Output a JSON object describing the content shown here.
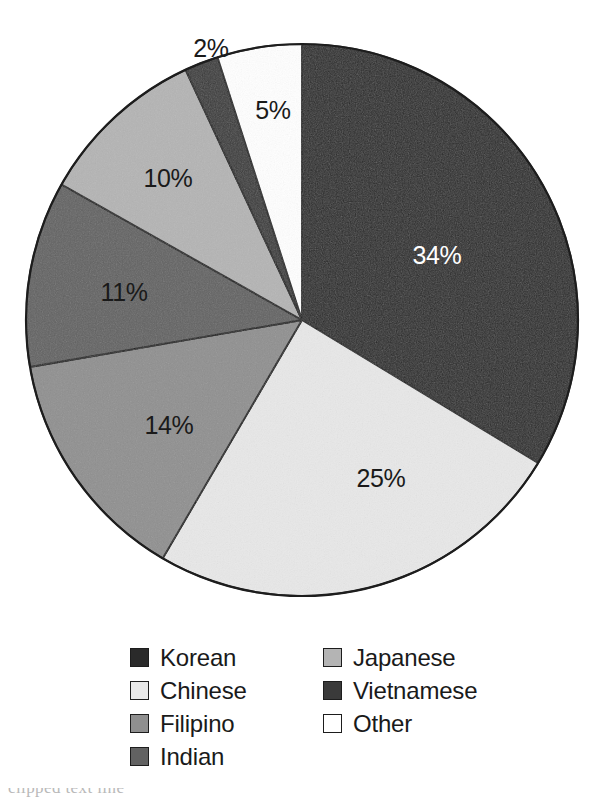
{
  "chart_data": {
    "type": "pie",
    "title": "",
    "subtitle": "",
    "xlabel": "",
    "ylabel": "",
    "units": "percent",
    "legend_position": "bottom",
    "grid": false,
    "start_angle_deg": 0,
    "direction": "clockwise",
    "categories": [
      "Korean",
      "Chinese",
      "Filipino",
      "Indian",
      "Japanese",
      "Vietnamese",
      "Other"
    ],
    "values": [
      34,
      25,
      14,
      11,
      10,
      2,
      5
    ],
    "data_labels": [
      "34%",
      "25%",
      "14%",
      "11%",
      "10%",
      "2%",
      "5%"
    ],
    "colors": [
      "#2a2a2a",
      "#e8e8e8",
      "#8f8f8f",
      "#626262",
      "#b4b4b4",
      "#3a3a3a",
      "#ffffff"
    ],
    "label_text_colors": [
      "#ffffff",
      "#1a1a1a",
      "#1a1a1a",
      "#1a1a1a",
      "#1a1a1a",
      "#1a1a1a",
      "#1a1a1a"
    ],
    "slices": [
      {
        "name": "Korean",
        "value": 34,
        "label": "34%",
        "color": "#2a2a2a",
        "label_color": "light",
        "label_x": 437,
        "label_y": 255,
        "start_deg": 0,
        "end_deg": 122.4
      },
      {
        "name": "Chinese",
        "value": 25,
        "label": "25%",
        "color": "#e8e8e8",
        "label_color": "dark",
        "label_x": 381,
        "label_y": 478,
        "start_deg": 122.4,
        "end_deg": 212.4
      },
      {
        "name": "Filipino",
        "value": 14,
        "label": "14%",
        "color": "#8f8f8f",
        "label_color": "dark",
        "label_x": 169,
        "label_y": 425,
        "start_deg": 212.4,
        "end_deg": 262.8
      },
      {
        "name": "Indian",
        "value": 11,
        "label": "11%",
        "color": "#626262",
        "label_color": "dark",
        "label_x": 124,
        "label_y": 292,
        "start_deg": 262.8,
        "end_deg": 302.4
      },
      {
        "name": "Japanese",
        "value": 10,
        "label": "10%",
        "color": "#b4b4b4",
        "label_color": "dark",
        "label_x": 168,
        "label_y": 178,
        "start_deg": 302.4,
        "end_deg": 338.4
      },
      {
        "name": "Vietnamese",
        "value": 2,
        "label": "2%",
        "color": "#3a3a3a",
        "label_color": "dark",
        "label_x": 211,
        "label_y": 48,
        "label_outside": true,
        "start_deg": 338.4,
        "end_deg": 345.6
      },
      {
        "name": "Other",
        "value": 5,
        "label": "5%",
        "color": "#ffffff",
        "label_color": "dark",
        "label_x": 273,
        "label_y": 110,
        "start_deg": 345.6,
        "end_deg": 360
      }
    ],
    "geometry": {
      "center_x": 302,
      "center_y": 320,
      "radius": 276,
      "outline_color": "#1d1d1d"
    }
  },
  "legend": {
    "columns": [
      {
        "items": [
          {
            "label": "Korean",
            "color": "#2a2a2a",
            "swatch": "swatch-korean"
          },
          {
            "label": "Chinese",
            "color": "#e8e8e8",
            "swatch": "swatch-chinese"
          },
          {
            "label": "Filipino",
            "color": "#8f8f8f",
            "swatch": "swatch-filipino"
          },
          {
            "label": "Indian",
            "color": "#626262",
            "swatch": "swatch-indian"
          }
        ]
      },
      {
        "items": [
          {
            "label": "Japanese",
            "color": "#b4b4b4",
            "swatch": "swatch-japanese"
          },
          {
            "label": "Vietnamese",
            "color": "#3a3a3a",
            "swatch": "swatch-vietnamese"
          },
          {
            "label": "Other",
            "color": "#ffffff",
            "swatch": "swatch-other"
          }
        ]
      }
    ]
  },
  "bottom_caption": {
    "text": "clipped text line"
  }
}
